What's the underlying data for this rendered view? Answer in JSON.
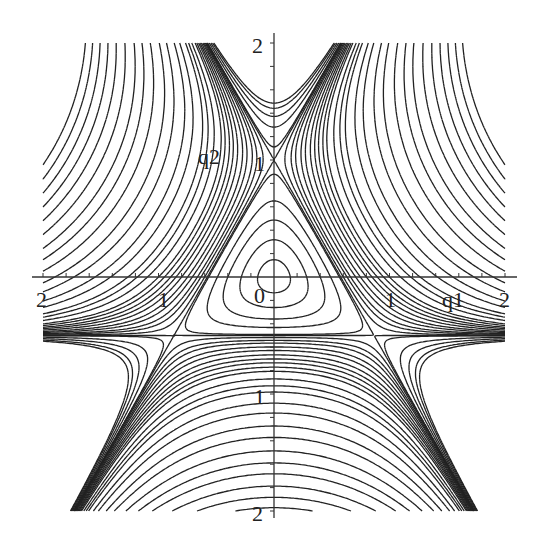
{
  "chart_data": {
    "type": "contour",
    "title": "",
    "xlabel": "q1",
    "ylabel": "q2",
    "function": "V(q1,q2) = (q1^2 + q2^2)/2 + q1^2*q2 - q2^3/3",
    "xlim": [
      -2,
      2
    ],
    "ylim": [
      -2,
      2
    ],
    "grid": false,
    "legend": null,
    "x_tick_labels": [
      "2",
      "1",
      "0",
      "1",
      "2"
    ],
    "x_tick_values": [
      -2,
      -1,
      0,
      1,
      2
    ],
    "y_tick_labels": [
      "2",
      "1",
      "1",
      "2"
    ],
    "y_tick_values": [
      2,
      1,
      -1,
      -2
    ],
    "contour_levels": [
      0.01,
      0.04,
      0.08,
      0.12,
      0.16,
      0.1667,
      0.18,
      0.2,
      0.22,
      0.25,
      0.28,
      0.32,
      0.36,
      0.4,
      0.45,
      0.5,
      0.6,
      0.7,
      0.8,
      1.0,
      1.2,
      1.5,
      1.8,
      2.2,
      2.6,
      3.0,
      3.5,
      4.0,
      4.5,
      5.0,
      5.5,
      6.0
    ],
    "annotations": [
      {
        "text": "0",
        "at": [
          -0.1,
          -0.1
        ]
      },
      {
        "text": "q1",
        "at": [
          1.55,
          -0.2
        ]
      },
      {
        "text": "q2",
        "at": [
          -0.6,
          1.1
        ]
      }
    ]
  },
  "axes": {
    "origin_px": [
      274,
      277
    ],
    "px_per_unit_x": 115.5,
    "px_per_unit_y": 117,
    "x_axis_px": [
      32,
      517
    ],
    "y_axis_px": [
      33,
      518
    ],
    "line_color": "#333333",
    "contour_color": "#222222",
    "labels": {
      "x_neg2": "2",
      "x_neg1": "1",
      "origin": "0",
      "x_pos1": "1",
      "x_pos2": "2",
      "y_pos2": "2",
      "y_pos1": "1",
      "y_neg1": "1",
      "y_neg2": "2",
      "q1": "q1",
      "q2": "q2"
    }
  }
}
